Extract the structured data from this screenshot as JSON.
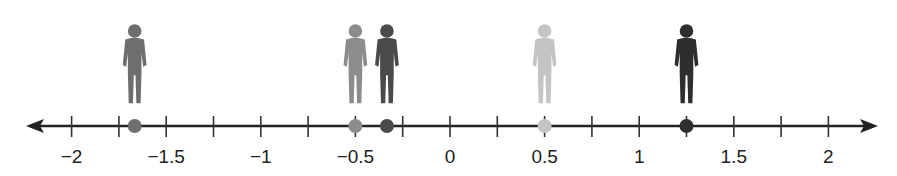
{
  "number_line": {
    "min": -2,
    "max": 2,
    "tick_step": 0.25,
    "labeled_ticks": [
      {
        "value": -2,
        "label": "−2"
      },
      {
        "value": -1.5,
        "label": "−1.5"
      },
      {
        "value": -1,
        "label": "−1"
      },
      {
        "value": -0.5,
        "label": "−0.5"
      },
      {
        "value": 0,
        "label": "0"
      },
      {
        "value": 0.5,
        "label": "0.5"
      },
      {
        "value": 1,
        "label": "1"
      },
      {
        "value": 1.5,
        "label": "1.5"
      },
      {
        "value": 2,
        "label": "2"
      }
    ],
    "arrows": "both"
  },
  "points": [
    {
      "value": -1.6667,
      "figure": "girl-long-hair",
      "color": "#6e6e6e"
    },
    {
      "value": -0.5,
      "figure": "boy-standing",
      "color": "#8c8c8c"
    },
    {
      "value": -0.3333,
      "figure": "boy-hands-on-hips",
      "color": "#4a4a4a"
    },
    {
      "value": 0.5,
      "figure": "girl-arms-crossed",
      "color": "#c4c4c4"
    },
    {
      "value": 1.25,
      "figure": "boy-shorts",
      "color": "#2e2e2e"
    }
  ],
  "chart_data": {
    "type": "number-line",
    "xlim": [
      -2,
      2
    ],
    "tick_step": 0.25,
    "tick_labels": [
      "−2",
      "−1.5",
      "−1",
      "−0.5",
      "0",
      "0.5",
      "1",
      "1.5",
      "2"
    ],
    "points": [
      -1.6667,
      -0.5,
      -0.3333,
      0.5,
      1.25
    ]
  }
}
